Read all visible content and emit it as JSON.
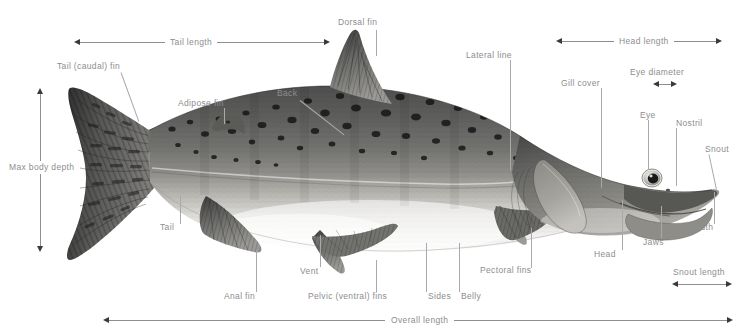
{
  "diagram": {
    "label_color": "#8d8d90",
    "leader_color": "#a9a9ad",
    "arrow_color": "#3a3a3c",
    "background": "#ffffff"
  },
  "labels": {
    "tail_length": "Tail length",
    "dorsal_fin": "Dorsal fin",
    "lateral_line": "Lateral line",
    "head_length": "Head length",
    "eye_diameter": "Eye diameter",
    "tail_caudal_fin": "Tail (caudal) fin",
    "gill_cover": "Gill cover",
    "eye": "Eye",
    "nostril": "Nostril",
    "snout": "Snout",
    "adipose_fin": "Adipose fin",
    "back": "Back",
    "max_body_depth": "Max body depth",
    "tail": "Tail",
    "mouth": "Mouth",
    "jaws": "Jaws",
    "head": "Head",
    "vent": "Vent",
    "pectoral_fins": "Pectoral fins",
    "anal_fin": "Anal fin",
    "pelvic_ventral_fins": "Pelvic (ventral) fins",
    "sides": "Sides",
    "belly": "Belly",
    "snout_length": "Snout length",
    "overall_length": "Overall length"
  }
}
